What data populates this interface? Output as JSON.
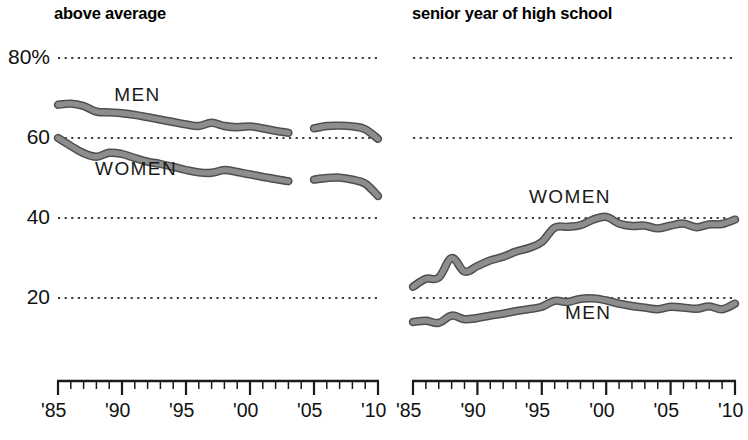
{
  "chart_data": [
    {
      "id": "left",
      "type": "line",
      "title": "above average",
      "xlabel": "",
      "ylabel": "",
      "ylim": [
        0,
        80
      ],
      "xlim": [
        1985,
        2010
      ],
      "grid": true,
      "gridlines": [
        80,
        60,
        40,
        20
      ],
      "ytick_labels": [
        "80%",
        "60",
        "40",
        "20"
      ],
      "ytick_values": [
        80,
        60,
        40,
        20
      ],
      "xtick_values": [
        1985,
        1990,
        1995,
        2000,
        2005,
        2010
      ],
      "xtick_labels": [
        "'85",
        "'90",
        "'95",
        "'00",
        "'05",
        "'10"
      ],
      "minor_xticks": true,
      "legend_position": "inline",
      "series": [
        {
          "name": "MEN",
          "label_x": 1989.4,
          "label_y": 70.5,
          "segments": [
            {
              "x": [
                1985,
                1986,
                1987,
                1988,
                1989,
                1990,
                1991,
                1992,
                1993,
                1994,
                1995,
                1996,
                1997,
                1998,
                1999,
                2000,
                2001,
                2002,
                2003
              ],
              "y": [
                68.3,
                68.6,
                68.0,
                66.6,
                66.4,
                66.2,
                65.8,
                65.2,
                64.6,
                64.0,
                63.4,
                63.0,
                63.8,
                63.0,
                62.7,
                62.9,
                62.4,
                61.8,
                61.3
              ]
            },
            {
              "x": [
                2005,
                2006,
                2007,
                2008,
                2009,
                2010
              ],
              "y": [
                62.4,
                63.0,
                63.1,
                62.9,
                62.2,
                59.8
              ]
            }
          ]
        },
        {
          "name": "WOMEN",
          "label_x": 1987.9,
          "label_y": 52.0,
          "segments": [
            {
              "x": [
                1985,
                1986,
                1987,
                1988,
                1989,
                1990,
                1991,
                1992,
                1993,
                1994,
                1995,
                1996,
                1997,
                1998,
                1999,
                2000,
                2001,
                2002,
                2003
              ],
              "y": [
                60.0,
                58.0,
                56.2,
                55.3,
                56.3,
                56.0,
                55.0,
                54.1,
                53.5,
                52.8,
                52.0,
                51.4,
                51.3,
                52.0,
                51.5,
                50.9,
                50.3,
                49.7,
                49.2
              ]
            },
            {
              "x": [
                2005,
                2006,
                2007,
                2008,
                2009,
                2010
              ],
              "y": [
                49.6,
                50.0,
                50.1,
                49.6,
                48.6,
                45.5
              ]
            }
          ]
        }
      ]
    },
    {
      "id": "right",
      "type": "line",
      "title": "senior year of high school",
      "xlabel": "",
      "ylabel": "",
      "ylim": [
        0,
        80
      ],
      "xlim": [
        1985,
        2010
      ],
      "grid": true,
      "gridlines": [
        80,
        60,
        40,
        20
      ],
      "ytick_labels": [],
      "ytick_values": [
        80,
        60,
        40,
        20
      ],
      "xtick_values": [
        1985,
        1990,
        1995,
        2000,
        2005,
        2010
      ],
      "xtick_labels": [
        "'85",
        "'90",
        "'95",
        "'00",
        "'05",
        "'10"
      ],
      "minor_xticks": true,
      "legend_position": "inline",
      "series": [
        {
          "name": "WOMEN",
          "label_x": 1994.0,
          "label_y": 45.0,
          "segments": [
            {
              "x": [
                1985,
                1986,
                1987,
                1988,
                1989,
                1990,
                1991,
                1992,
                1993,
                1994,
                1995,
                1996,
                1997,
                1998,
                1999,
                2000,
                2001,
                2002,
                2003,
                2004,
                2005,
                2006,
                2007,
                2008,
                2009,
                2010
              ],
              "y": [
                22.8,
                24.8,
                25.1,
                30.0,
                26.6,
                28.0,
                29.4,
                30.3,
                31.6,
                32.5,
                34.0,
                37.6,
                37.8,
                38.2,
                39.6,
                40.3,
                38.6,
                38.0,
                38.1,
                37.4,
                38.1,
                38.6,
                37.7,
                38.4,
                38.5,
                39.6
              ]
            }
          ]
        },
        {
          "name": "MEN",
          "label_x": 1996.8,
          "label_y": 16.0,
          "segments": [
            {
              "x": [
                1985,
                1986,
                1987,
                1988,
                1989,
                1990,
                1991,
                1992,
                1993,
                1994,
                1995,
                1996,
                1997,
                1998,
                1999,
                2000,
                2001,
                2002,
                2003,
                2004,
                2005,
                2006,
                2007,
                2008,
                2009,
                2010
              ],
              "y": [
                14.0,
                14.3,
                13.8,
                15.6,
                14.7,
                15.0,
                15.6,
                16.1,
                16.7,
                17.2,
                17.8,
                19.3,
                19.0,
                19.8,
                19.9,
                19.4,
                18.6,
                18.0,
                17.6,
                17.2,
                17.8,
                17.6,
                17.3,
                17.9,
                17.2,
                18.6
              ]
            }
          ]
        }
      ]
    }
  ],
  "style": {
    "line_fill": "#8d8d8d",
    "line_stroke": "#4f4f4f",
    "grid_color": "#000000",
    "axis_color": "#1a1a1a",
    "text_color": "#111111"
  }
}
